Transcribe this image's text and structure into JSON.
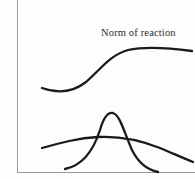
{
  "figure": {
    "background_color": "#fdfdfd",
    "frame_color": "#9a9a9a",
    "stroke_color": "#1a1a1a",
    "label": "Norm of reaction",
    "chart_data": {
      "type": "line",
      "title": "Norm of reaction",
      "xlabel": "",
      "ylabel": "",
      "grid": false,
      "legend_position": "none",
      "annotations": [
        {
          "text": "Norm of reaction",
          "x": 101,
          "y": 33,
          "points_to": "sigmoid-curve"
        }
      ],
      "series": [
        {
          "name": "Norm of reaction (sigmoid)",
          "shape": "sigmoid",
          "path": "M 42 88 C 56 93, 72 93, 86 82 C 100 70, 110 55, 128 50 C 146 46, 170 48, 192 51",
          "x": [
            42,
            56,
            72,
            86,
            100,
            114,
            128,
            146,
            170,
            192
          ],
          "y": [
            88,
            91,
            90,
            82,
            70,
            58,
            50,
            48,
            48,
            51
          ]
        },
        {
          "name": "Narrow distribution",
          "shape": "narrow-bell",
          "path": "M 65 169 C 80 166, 92 155, 100 130 C 104 116, 108 112, 113 113 C 120 115, 124 132, 132 150 C 139 164, 148 170, 158 172",
          "x": [
            65,
            80,
            92,
            100,
            108,
            113,
            124,
            132,
            148,
            158
          ],
          "y": [
            169,
            166,
            155,
            130,
            112,
            113,
            132,
            150,
            170,
            172
          ]
        },
        {
          "name": "Wide distribution",
          "shape": "wide-flat",
          "path": "M 42 148 C 60 143, 78 138, 98 137 C 118 136, 140 140, 160 148 C 172 153, 183 158, 193 162",
          "x": [
            42,
            60,
            78,
            98,
            118,
            140,
            160,
            176,
            193
          ],
          "y": [
            148,
            143,
            138,
            137,
            136,
            140,
            148,
            155,
            162
          ]
        }
      ],
      "crossings": [
        {
          "series": [
            "Narrow distribution",
            "Wide distribution"
          ],
          "x": 98,
          "y": 139
        },
        {
          "series": [
            "Narrow distribution",
            "Wide distribution"
          ],
          "x": 133,
          "y": 141
        }
      ]
    }
  }
}
